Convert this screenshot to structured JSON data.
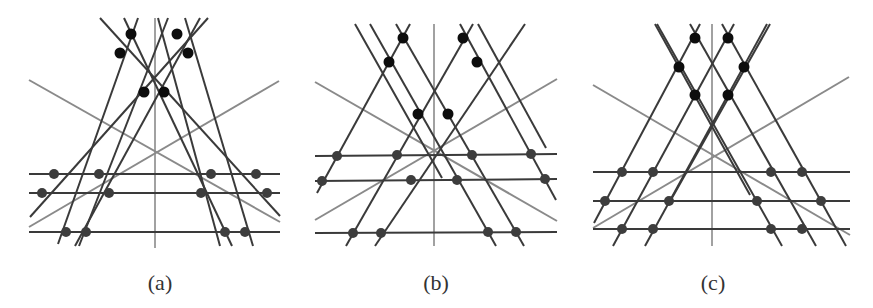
{
  "figure": {
    "width": 873,
    "height": 308,
    "colors": {
      "dark_line": "#3a3a3a",
      "gray_line": "#8a8a8a",
      "top_dot": "#0d0d0d",
      "bottom_dot": "#3d3d3d",
      "label": "#333333"
    }
  },
  "panels": [
    {
      "id": "a",
      "label": "(a)",
      "label_pos": [
        160,
        284
      ],
      "axis": [
        155,
        18,
        155,
        248
      ],
      "gray_diagonals": [
        [
          29,
          80,
          280,
          222
        ],
        [
          29,
          227,
          279,
          81
        ]
      ],
      "dark_lines": [
        [
          138,
          18,
          58,
          244
        ],
        [
          124,
          18,
          232,
          246
        ],
        [
          168,
          18,
          79,
          246
        ],
        [
          200,
          18,
          75,
          246
        ],
        [
          208,
          18,
          30,
          217
        ],
        [
          100,
          18,
          280,
          216
        ],
        [
          185,
          18,
          253,
          246
        ],
        [
          158,
          18,
          220,
          246
        ]
      ],
      "horizontals": [
        [
          29,
          174,
          280,
          174
        ],
        [
          29,
          193,
          280,
          193
        ],
        [
          29,
          232,
          280,
          232
        ]
      ],
      "top_dots": [
        [
          131,
          34
        ],
        [
          177,
          34
        ],
        [
          120,
          53
        ],
        [
          188,
          53
        ],
        [
          144,
          92
        ],
        [
          164,
          92
        ]
      ],
      "bottom_dots": [
        [
          54,
          174
        ],
        [
          99,
          174
        ],
        [
          211,
          174
        ],
        [
          256,
          174
        ],
        [
          42,
          193
        ],
        [
          109,
          193
        ],
        [
          201,
          193
        ],
        [
          267,
          193
        ],
        [
          66,
          232
        ],
        [
          86,
          232
        ],
        [
          225,
          232
        ],
        [
          245,
          232
        ]
      ]
    },
    {
      "id": "b",
      "label": "(b)",
      "label_pos": [
        436,
        284
      ],
      "axis": [
        434,
        24,
        434,
        246
      ],
      "gray_diagonals": [
        [
          315,
          82,
          557,
          221
        ],
        [
          315,
          220,
          557,
          79
        ]
      ],
      "dark_lines": [
        [
          370,
          24,
          496,
          246
        ],
        [
          396,
          24,
          524,
          246
        ],
        [
          410,
          24,
          317,
          193
        ],
        [
          473,
          24,
          346,
          246
        ],
        [
          525,
          24,
          375,
          246
        ],
        [
          460,
          24,
          556,
          200
        ],
        [
          478,
          24,
          546,
          148
        ],
        [
          355,
          24,
          442,
          178
        ]
      ],
      "horizontals": [
        [
          315,
          156,
          557,
          154
        ],
        [
          315,
          181,
          557,
          179
        ],
        [
          315,
          233,
          557,
          232
        ]
      ],
      "top_dots": [
        [
          403,
          38
        ],
        [
          463,
          38
        ],
        [
          389,
          62
        ],
        [
          477,
          62
        ],
        [
          418,
          114
        ],
        [
          448,
          114
        ]
      ],
      "bottom_dots": [
        [
          337,
          156
        ],
        [
          397,
          155
        ],
        [
          472,
          155
        ],
        [
          531,
          154
        ],
        [
          322,
          181
        ],
        [
          411,
          180
        ],
        [
          457,
          180
        ],
        [
          545,
          179
        ],
        [
          353,
          233
        ],
        [
          381,
          233
        ],
        [
          488,
          232
        ],
        [
          516,
          232
        ]
      ]
    },
    {
      "id": "c",
      "label": "(c)",
      "label_pos": [
        713,
        284
      ],
      "axis": [
        712,
        24,
        712,
        246
      ],
      "gray_diagonals": [
        [
          593,
          85,
          850,
          235
        ],
        [
          593,
          228,
          849,
          77
        ]
      ],
      "dark_lines": [
        [
          657,
          24,
          782,
          246
        ],
        [
          690,
          24,
          816,
          246
        ],
        [
          700,
          24,
          594,
          223
        ],
        [
          734,
          24,
          613,
          246
        ],
        [
          767,
          24,
          645,
          246
        ],
        [
          722,
          24,
          846,
          246
        ],
        [
          655,
          24,
          750,
          195
        ],
        [
          770,
          24,
          668,
          205
        ]
      ],
      "horizontals": [
        [
          593,
          172,
          850,
          172
        ],
        [
          593,
          201,
          850,
          201
        ],
        [
          593,
          229,
          850,
          229
        ]
      ],
      "top_dots": [
        [
          695,
          38
        ],
        [
          728,
          38
        ],
        [
          679,
          67
        ],
        [
          744,
          67
        ],
        [
          695,
          95
        ],
        [
          728,
          95
        ]
      ],
      "bottom_dots": [
        [
          622,
          172
        ],
        [
          653,
          172
        ],
        [
          771,
          172
        ],
        [
          802,
          172
        ],
        [
          605,
          201
        ],
        [
          669,
          201
        ],
        [
          757,
          201
        ],
        [
          821,
          201
        ],
        [
          622,
          229
        ],
        [
          653,
          229
        ],
        [
          771,
          229
        ],
        [
          802,
          229
        ]
      ]
    }
  ]
}
